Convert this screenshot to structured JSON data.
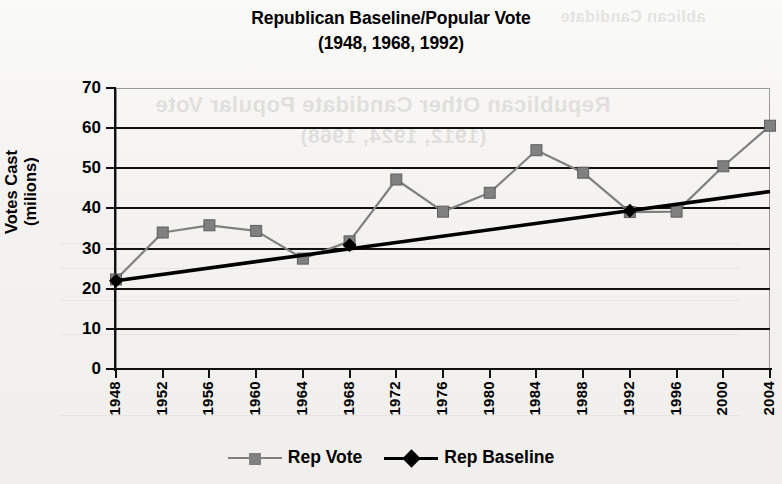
{
  "title": {
    "line1": "Republican Baseline/Popular Vote",
    "line2": "(1948, 1968, 1992)"
  },
  "axes": {
    "ytitle_line1": "Votes Cast",
    "ytitle_line2": "(milions)"
  },
  "legend": {
    "items": [
      {
        "label": "Rep Vote",
        "color": "#808080",
        "marker": "square"
      },
      {
        "label": "Rep Baseline",
        "color": "#000000",
        "marker": "diamond"
      }
    ]
  },
  "ghost": {
    "top_text": "ablican Candidate",
    "line1": "Republican Other Candidate Popular Vote",
    "line2": "(1912, 1924, 1968)"
  },
  "chart_data": {
    "type": "line",
    "title": "Republican Baseline/Popular Vote (1948, 1968, 1992)",
    "xlabel": "",
    "ylabel": "Votes Cast (milions)",
    "ylim": [
      0,
      70
    ],
    "yticks": [
      0,
      10,
      20,
      30,
      40,
      50,
      60,
      70
    ],
    "grid": true,
    "legend_position": "bottom",
    "categories": [
      1948,
      1952,
      1956,
      1960,
      1964,
      1968,
      1972,
      1976,
      1980,
      1984,
      1988,
      1992,
      1996,
      2000,
      2004
    ],
    "xtick_labels": [
      "1948",
      "1952",
      "1956",
      "1960",
      "1964",
      "1968",
      "1972",
      "1976",
      "1980",
      "1984",
      "1988",
      "1992",
      "1996",
      "2000",
      "2004"
    ],
    "series": [
      {
        "name": "Rep Vote",
        "color": "#808080",
        "marker": "square",
        "values": [
          22.3,
          34.0,
          35.8,
          34.4,
          27.5,
          31.8,
          47.2,
          39.2,
          43.9,
          54.5,
          48.9,
          39.1,
          39.2,
          50.5,
          60.6
        ]
      },
      {
        "name": "Rep Baseline",
        "color": "#000000",
        "marker": "diamond",
        "marker_points": [
          1948,
          1968,
          1992
        ],
        "values": [
          22.0,
          23.6,
          25.2,
          26.8,
          28.4,
          30.9,
          32.6,
          34.2,
          35.8,
          37.4,
          38.2,
          39.4,
          41.0,
          42.6,
          44.2
        ]
      }
    ]
  }
}
